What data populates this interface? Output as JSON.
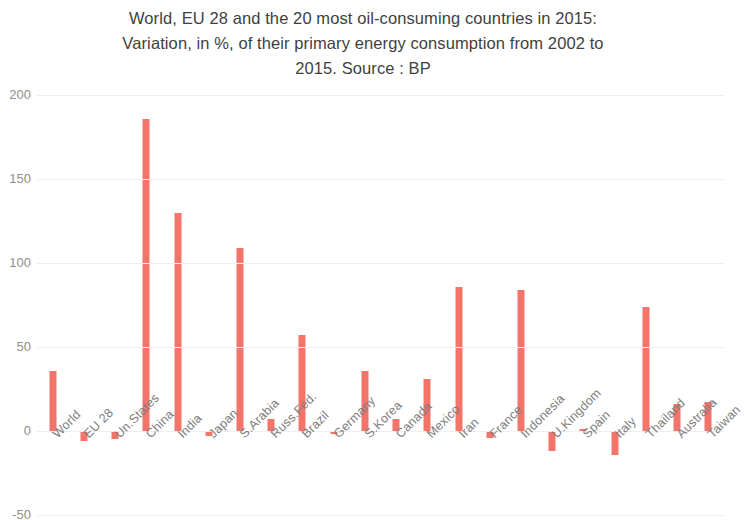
{
  "chart_data": {
    "type": "bar",
    "title": "World, EU 28 and the 20 most oil-consuming countries in 2015:\nVariation, in %, of their primary energy consumption from 2002 to\n2015. Source : BP",
    "title_line1": "World, EU 28 and the 20 most oil-consuming countries in 2015:",
    "title_line2": "Variation, in %, of their primary energy consumption from 2002 to",
    "title_line3": "2015. Source : BP",
    "xlabel": "",
    "ylabel": "",
    "ylim": [
      -50,
      200
    ],
    "yticks": [
      200,
      150,
      100,
      50,
      0,
      -50
    ],
    "ytick_labels": [
      "200",
      "150",
      "100",
      "50",
      "0",
      "-50"
    ],
    "grid": true,
    "legend": "none",
    "bar_color": "#f4746a",
    "categories": [
      "World",
      "EU 28",
      "Un.States",
      "China",
      "India",
      "Japan",
      "S.Arabia",
      "Russ.Fed.",
      "Brazil",
      "Germany",
      "S.Korea",
      "Canada",
      "Mexico",
      "Iran",
      "France",
      "Indonesia",
      "U.Kingdom",
      "Spain",
      "Italy",
      "Thailand",
      "Australia",
      "Taiwan"
    ],
    "values": [
      36,
      -6,
      -5,
      186,
      130,
      -3,
      109,
      7,
      57,
      -2,
      36,
      7,
      31,
      86,
      -4,
      84,
      -12,
      1,
      -14,
      74,
      16,
      17
    ],
    "units": "%"
  }
}
